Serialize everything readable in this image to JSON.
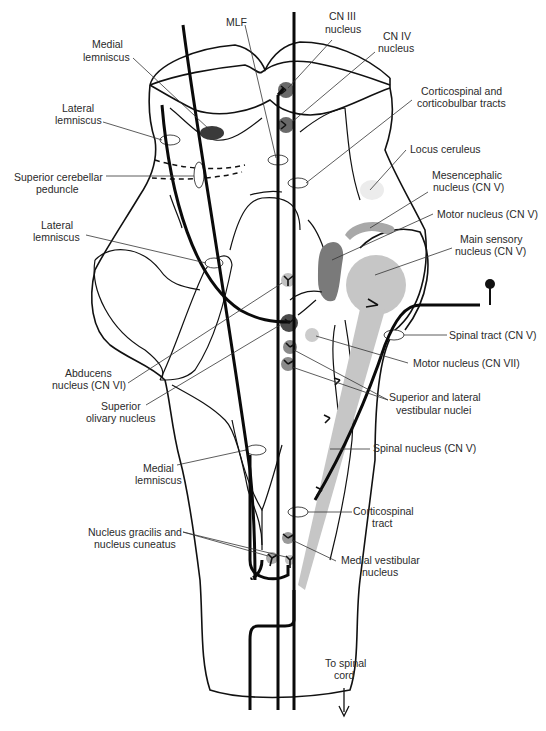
{
  "figure": {
    "colors": {
      "line": "#111111",
      "nucleus_dark": "#555555",
      "nucleus_mid": "#8a8a8a",
      "nucleus_light": "#c8c8c8",
      "nucleus_pale": "#e4e4e4",
      "background": "#ffffff"
    }
  },
  "labels": {
    "mlf": "MLF",
    "cn3_l1": "CN III",
    "cn3_l2": "nucleus",
    "cn4_l1": "CN IV",
    "cn4_l2": "nucleus",
    "medial_lemniscus_top_l1": "Medial",
    "medial_lemniscus_top_l2": "lemniscus",
    "lateral_lemniscus_top_l1": "Lateral",
    "lateral_lemniscus_top_l2": "lemniscus",
    "corticospinal_bulbar_l1": "Corticospinal and",
    "corticospinal_bulbar_l2": "corticobulbar tracts",
    "superior_cerebellar_l1": "Superior cerebellar",
    "superior_cerebellar_l2": "peduncle",
    "locus_ceruleus": "Locus ceruleus",
    "mesencephalic_l1": "Mesencephalic",
    "mesencephalic_l2": "nucleus (CN V)",
    "lateral_lemniscus_mid_l1": "Lateral",
    "lateral_lemniscus_mid_l2": "lemniscus",
    "motor_cn5": "Motor nucleus (CN V)",
    "main_sensory_l1": "Main sensory",
    "main_sensory_l2": "nucleus (CN V)",
    "spinal_tract_cn5": "Spinal tract (CN V)",
    "abducens_l1": "Abducens",
    "abducens_l2": "nucleus (CN VI)",
    "motor_cn7": "Motor nucleus (CN VII)",
    "superior_olivary_l1": "Superior",
    "superior_olivary_l2": "olivary nucleus",
    "sup_lat_vestibular_l1": "Superior and lateral",
    "sup_lat_vestibular_l2": "vestibular nuclei",
    "spinal_nucleus_cn5": "Spinal nucleus (CN V)",
    "medial_lemniscus_bot_l1": "Medial",
    "medial_lemniscus_bot_l2": "lemniscus",
    "corticospinal_tract_l1": "Corticospinal",
    "corticospinal_tract_l2": "tract",
    "gracilis_cuneatus_l1": "Nucleus gracilis and",
    "gracilis_cuneatus_l2": "nucleus cuneatus",
    "medial_vestibular_l1": "Medial vestibular",
    "medial_vestibular_l2": "nucleus",
    "to_spinal_cord_l1": "To spinal",
    "to_spinal_cord_l2": "cord"
  }
}
